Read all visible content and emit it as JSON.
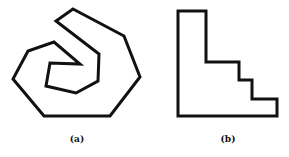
{
  "figures": [
    {
      "id": "a",
      "label": "(a)",
      "shape": "spiral polygon",
      "points": [
        [
          73,
          9
        ],
        [
          124,
          36
        ],
        [
          140,
          77
        ],
        [
          110,
          116
        ],
        [
          44,
          116
        ],
        [
          13,
          79
        ],
        [
          28,
          51
        ],
        [
          54,
          42
        ],
        [
          80,
          64
        ],
        [
          50,
          63
        ],
        [
          46,
          86
        ],
        [
          76,
          93
        ],
        [
          98,
          81
        ],
        [
          99,
          54
        ],
        [
          56,
          21
        ]
      ],
      "label_pos": [
        77,
        141
      ]
    },
    {
      "id": "b",
      "label": "(b)",
      "shape": "staircase polygon",
      "points": [
        [
          178,
          11
        ],
        [
          206,
          11
        ],
        [
          206,
          62
        ],
        [
          239,
          62
        ],
        [
          239,
          80
        ],
        [
          252,
          80
        ],
        [
          252,
          99
        ],
        [
          277,
          99
        ],
        [
          277,
          116
        ],
        [
          178,
          116
        ]
      ],
      "label_pos": [
        228,
        141
      ]
    }
  ],
  "style": {
    "stroke": "#111111",
    "stroke_width": 3
  }
}
